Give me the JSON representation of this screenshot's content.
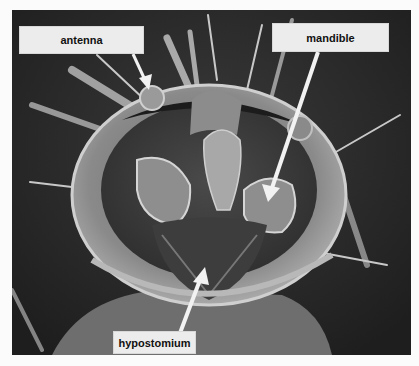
{
  "figure": {
    "labels": [
      {
        "id": "antenna",
        "text": "antenna"
      },
      {
        "id": "mandible",
        "text": "mandible"
      },
      {
        "id": "hypostomium",
        "text": "hypostomium"
      }
    ]
  }
}
